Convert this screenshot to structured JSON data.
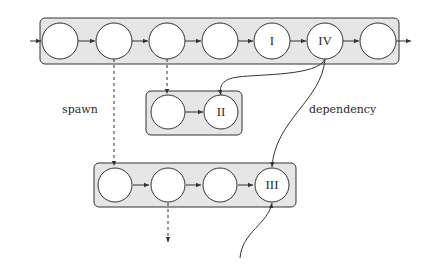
{
  "labels": {
    "spawn": "spawn",
    "dependency": "dependency"
  },
  "colors": {
    "box_fill": "#e6e6e6",
    "stroke": "#333333",
    "node_fill": "#ffffff"
  },
  "groups": [
    {
      "id": "main-chain",
      "box": {
        "x": 40,
        "y": 18,
        "w": 359,
        "h": 46
      },
      "nodes": [
        {
          "cx": 60,
          "cy": 41,
          "label": ""
        },
        {
          "cx": 114,
          "cy": 41,
          "label": ""
        },
        {
          "cx": 167,
          "cy": 41,
          "label": ""
        },
        {
          "cx": 220,
          "cy": 41,
          "label": ""
        },
        {
          "cx": 272,
          "cy": 41,
          "label": "I"
        },
        {
          "cx": 325,
          "cy": 41,
          "label": "IV"
        },
        {
          "cx": 378,
          "cy": 41,
          "label": ""
        }
      ]
    },
    {
      "id": "chain-ii",
      "box": {
        "x": 146,
        "y": 91,
        "w": 96,
        "h": 44
      },
      "nodes": [
        {
          "cx": 168,
          "cy": 112,
          "label": ""
        },
        {
          "cx": 221,
          "cy": 112,
          "label": "II"
        }
      ]
    },
    {
      "id": "chain-iii",
      "box": {
        "x": 94,
        "y": 163,
        "w": 202,
        "h": 44
      },
      "nodes": [
        {
          "cx": 115,
          "cy": 185,
          "label": ""
        },
        {
          "cx": 168,
          "cy": 185,
          "label": ""
        },
        {
          "cx": 220,
          "cy": 185,
          "label": ""
        },
        {
          "cx": 272,
          "cy": 185,
          "label": "III"
        }
      ]
    }
  ]
}
